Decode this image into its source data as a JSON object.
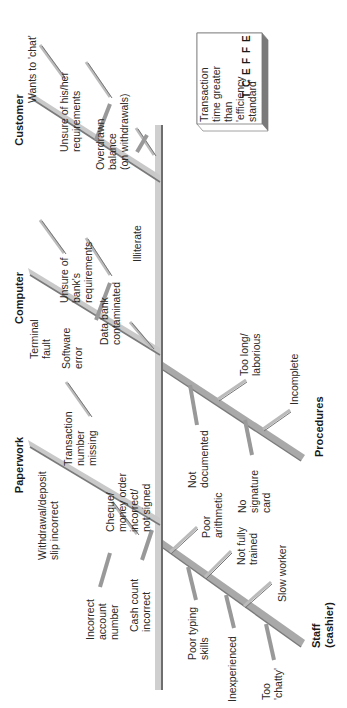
{
  "diagram": {
    "type": "fishbone (cause-and-effect)",
    "orientation": "rotated 90 degrees counter-clockwise",
    "effect": {
      "heading": "EFFECT",
      "letters": [
        "E",
        "F",
        "F",
        "E",
        "C",
        "T"
      ],
      "text_lines": [
        "Transaction",
        "time greater",
        "than",
        "'efficiency",
        "standard'"
      ]
    },
    "categories": {
      "customer": {
        "label": "Customer",
        "causes": [
          {
            "lines": [
              "Wants to 'chat'"
            ]
          },
          {
            "lines": [
              "Unsure of his/her",
              "requirements"
            ]
          },
          {
            "lines": [
              "Overdrawn",
              "balance",
              "(on withdrawals)"
            ]
          },
          {
            "lines": [
              "Unsure of",
              "bank's",
              "requirements"
            ]
          },
          {
            "lines": [
              "Illiterate"
            ]
          }
        ]
      },
      "computer": {
        "label": "Computer",
        "causes": [
          {
            "lines": [
              "Terminal",
              "fault"
            ]
          },
          {
            "lines": [
              "Software",
              "error"
            ]
          },
          {
            "lines": [
              "Data bank",
              "contaminated"
            ]
          },
          {
            "lines": [
              "Transaction",
              "number",
              "missing"
            ]
          }
        ]
      },
      "paperwork": {
        "label": "Paperwork",
        "causes": [
          {
            "lines": [
              "Withdrawal/deposit",
              "slip incorrect"
            ]
          },
          {
            "lines": [
              "Cheque/",
              "money order",
              "incorrect/",
              "not signed"
            ]
          },
          {
            "lines": [
              "Incorrect",
              "account",
              "number"
            ]
          },
          {
            "lines": [
              "Cash count",
              "incorrect"
            ]
          }
        ]
      },
      "procedures": {
        "label": "Procedures",
        "causes": [
          {
            "lines": [
              "Too long/",
              "laborious"
            ]
          },
          {
            "lines": [
              "Incomplete"
            ]
          },
          {
            "lines": [
              "Not",
              "documented"
            ]
          },
          {
            "lines": [
              "No",
              "signature",
              "card"
            ]
          }
        ]
      },
      "staff": {
        "label_lines": [
          "Staff",
          "(cashier)"
        ],
        "causes": [
          {
            "lines": [
              "Poor",
              "arithmetic"
            ]
          },
          {
            "lines": [
              "Not fully",
              "trained"
            ]
          },
          {
            "lines": [
              "Slow worker"
            ]
          },
          {
            "lines": [
              "Poor typing",
              "skills"
            ]
          },
          {
            "lines": [
              "Inexperienced"
            ]
          },
          {
            "lines": [
              "Too",
              "'chatty'"
            ]
          }
        ]
      }
    },
    "colors": {
      "spine": "#b9b9b9",
      "spine_shadow": "#6e6e6e",
      "bone_light": "#c8c8c8",
      "bone_dark": "#8a8a8a",
      "box_border": "#777777",
      "box_top": "#7a7a7a",
      "text": "#2a2a2a"
    }
  }
}
